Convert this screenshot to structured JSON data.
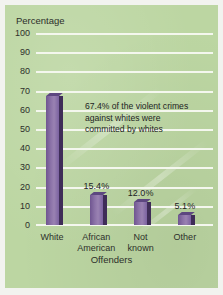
{
  "chart_data": {
    "type": "bar",
    "title": "",
    "ylabel": "Percentage",
    "xlabel": "Offenders",
    "categories": [
      "White",
      "African\nAmerican",
      "Not\nknown",
      "Other"
    ],
    "values": [
      67.4,
      15.4,
      12.0,
      5.1
    ],
    "value_labels": [
      "67.4%",
      "15.4%",
      "12.0%",
      "5.1%"
    ],
    "first_bar_value_shown_in_annotation": true,
    "ylim": [
      0,
      100
    ],
    "yticks": [
      100,
      90,
      80,
      70,
      60,
      50,
      40,
      30,
      20,
      10,
      0
    ],
    "ytick_labels": [
      "100",
      "90",
      "80",
      "70",
      "60",
      "50",
      "40",
      "30",
      "20",
      "10",
      "0"
    ],
    "grid": true,
    "legend": "none",
    "annotations": [
      "67.4% of the violent crimes against whites were committed by whites"
    ],
    "colors": {
      "bar_face": "#8c73a8",
      "bar_shadow": "#3f2d58",
      "panel_background": "#bcd6a2",
      "gridline": "#f4f7ee",
      "text": "#2d2f2b"
    }
  },
  "annotation": {
    "line1": "67.4% of the violent crimes",
    "line2": "against whites were",
    "line3": "committed by whites"
  }
}
